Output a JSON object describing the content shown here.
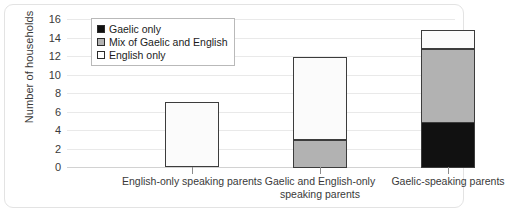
{
  "chart_data": {
    "type": "bar",
    "stacked": true,
    "title": "",
    "xlabel": "",
    "ylabel": "Number of households",
    "ylim": [
      0,
      16
    ],
    "ytick_step": 2,
    "yticks": [
      16,
      14,
      12,
      10,
      8,
      6,
      4,
      2,
      0
    ],
    "grid": true,
    "legend_position": "top-left-inside",
    "categories": [
      "English-only speaking parents",
      "Gaelic and English-only speaking parents",
      "Gaelic-speaking parents"
    ],
    "series": [
      {
        "name": "Gaelic only",
        "color": "#111111",
        "values": [
          0,
          0,
          5
        ]
      },
      {
        "name": "Mix of Gaelic and English",
        "color": "#b2b2b2",
        "values": [
          0,
          3,
          8
        ]
      },
      {
        "name": "English only",
        "color": "#fbfbfb",
        "values": [
          7,
          9,
          2
        ]
      }
    ],
    "totals": [
      7,
      12,
      15
    ]
  },
  "legend": {
    "items": [
      {
        "label": "Gaelic only",
        "color": "#111111"
      },
      {
        "label": "Mix of Gaelic and English",
        "color": "#b2b2b2"
      },
      {
        "label": "English only",
        "color": "#ffffff"
      }
    ]
  }
}
